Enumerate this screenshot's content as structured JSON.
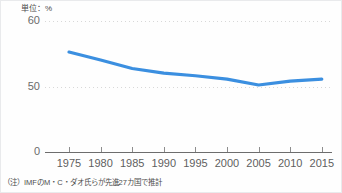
{
  "unit_label": "単位：%",
  "note": "（注）IMFのM・C・ダオ氏らが先進27カ国で推計",
  "colors": {
    "line": "#3b8fe0",
    "gridline": "#d8d8d8",
    "axis": "#6d6d6d",
    "tick_text": "#5e5e5e",
    "background": "#fefefe"
  },
  "axes": {
    "y_ticks": [
      "0",
      "50",
      "60"
    ],
    "y_tick_0": "0",
    "y_tick_50": "50",
    "y_tick_60": "60",
    "x_ticks": [
      "1975",
      "1980",
      "1985",
      "1990",
      "1995",
      "2000",
      "2005",
      "2010",
      "2015"
    ]
  },
  "chart_data": {
    "type": "line",
    "title": "",
    "subtitle": "",
    "xlabel": "",
    "ylabel": "",
    "unit": "%",
    "x": [
      1975,
      1980,
      1985,
      1990,
      1995,
      2000,
      2005,
      2010,
      2015
    ],
    "series": [
      {
        "name": "労働分配率",
        "values": [
          55.3,
          54.1,
          52.8,
          52.1,
          51.7,
          51.2,
          50.3,
          50.9,
          51.2
        ]
      }
    ],
    "xlim": [
      1975,
      2015
    ],
    "ylim": [
      50,
      60
    ],
    "y_axis_broken": true,
    "y_axis_break_below": 50,
    "grid": "horizontal-dotted",
    "legend": "none",
    "annotations": [
      "単位：%",
      "（注）IMFのM・C・ダオ氏らが先進27カ国で推計"
    ]
  }
}
